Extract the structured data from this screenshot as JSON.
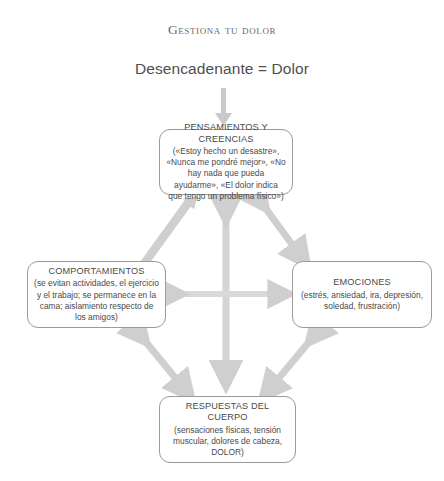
{
  "diagram": {
    "title": "Gestiona tu dolor",
    "trigger": "Desencadenante = Dolor",
    "arrow_color": "#cfcfcf",
    "box_border_color": "#9b9b9b",
    "text_color": "#4a4a4a",
    "nodes": {
      "thoughts": {
        "title": "PENSAMIENTOS Y CREENCIAS",
        "body": "(«Estoy hecho un desastre», «Nunca me pondré mejor», «No hay nada que pueda ayudarme», «El dolor indica que tengo un problema físico»)"
      },
      "behaviors": {
        "title": "COMPORTAMIENTOS",
        "body": "(se evitan actividades, el ejercicio y el trabajo; se permanece en la cama; aislamiento respecto de los amigos)"
      },
      "emotions": {
        "title": "EMOCIONES",
        "body": "(estrés, ansiedad, ira, depresión, soledad, frustración)"
      },
      "body_responses": {
        "title": "RESPUESTAS DEL CUERPO",
        "body": "(sensaciones físicas, tensión muscular, dolores de cabeza, DOLOR)"
      }
    },
    "connectors": [
      {
        "name": "trigger-to-thoughts",
        "type": "single-down"
      },
      {
        "name": "thoughts-behaviors",
        "type": "double-diagonal"
      },
      {
        "name": "thoughts-emotions",
        "type": "double-diagonal"
      },
      {
        "name": "behaviors-body",
        "type": "double-diagonal"
      },
      {
        "name": "emotions-body",
        "type": "double-diagonal"
      },
      {
        "name": "behaviors-emotions",
        "type": "double-horizontal"
      },
      {
        "name": "thoughts-body",
        "type": "double-vertical"
      }
    ]
  }
}
